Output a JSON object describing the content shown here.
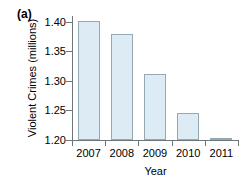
{
  "figure": {
    "panel_label": "(a)"
  },
  "chart_data": {
    "type": "bar",
    "title": "",
    "xlabel": "Year",
    "ylabel": "Violent Crimes (millions)",
    "categories": [
      "2007",
      "2008",
      "2009",
      "2010",
      "2011"
    ],
    "values": [
      1.402,
      1.38,
      1.312,
      1.246,
      1.203
    ],
    "ylim": [
      1.2,
      1.41
    ],
    "yticks": [
      1.4,
      1.35,
      1.3,
      1.25,
      1.2
    ],
    "ytick_labels": [
      "1.40",
      "1.35",
      "1.30",
      "1.25",
      "1.20"
    ],
    "grid": false,
    "legend": null,
    "colors": {
      "bar_fill": "#dcebf4",
      "bar_edge": "#93a9b5",
      "axis": "#6d7678",
      "text": "#000000"
    }
  }
}
